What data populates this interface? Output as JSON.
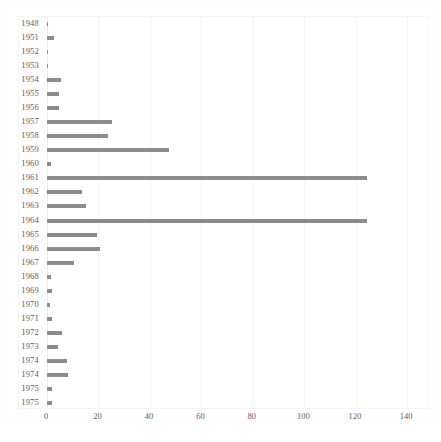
{
  "chart_data": {
    "type": "bar",
    "orientation": "horizontal",
    "title": "",
    "subtitle": "",
    "xlabel": "",
    "ylabel": "",
    "xlim": [
      0,
      145
    ],
    "ylim": null,
    "grid": true,
    "grid_axis": "x",
    "legend": null,
    "legend_position": "none",
    "bar_color": "#8c8c8c",
    "background_color": "#ffffff",
    "xticks": [
      0,
      20,
      40,
      60,
      80,
      100,
      120,
      140
    ],
    "xtick_labels": [
      "0",
      "20",
      "40",
      "60",
      "80",
      "100",
      "120",
      "140"
    ],
    "categories": [
      "1948",
      "1951",
      "1952",
      "1953",
      "1954",
      "1955",
      "1956",
      "1957",
      "1958",
      "1959",
      "1960",
      "1961",
      "1962",
      "1963",
      "1964",
      "1965",
      "1966",
      "1967",
      "1968",
      "1969",
      "1970",
      "1971",
      "1972",
      "1973",
      "1974",
      "1974",
      "1975",
      "1975"
    ],
    "values": [
      0.4,
      2.6,
      0.4,
      0.4,
      5.6,
      4.7,
      4.7,
      25.3,
      23.7,
      47.4,
      1.7,
      124.4,
      13.7,
      15.0,
      124.4,
      19.5,
      20.7,
      10.4,
      1.6,
      2.1,
      1.3,
      1.8,
      6.0,
      4.2,
      7.8,
      8.0,
      1.8,
      1.8
    ]
  }
}
